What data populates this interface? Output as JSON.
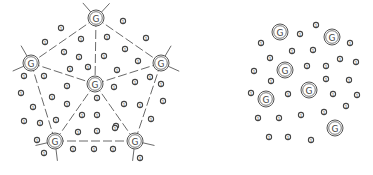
{
  "diagram": {
    "gateway_label": "G",
    "sensor_label": "1",
    "colors": {
      "stroke": "#555555",
      "edge": "#6a6a6a",
      "background": "#ffffff"
    },
    "left_panel": {
      "name": "structured-deployment",
      "gateways": [
        {
          "id": "g-top",
          "x": 96,
          "y": 18
        },
        {
          "id": "g-left",
          "x": 31,
          "y": 63
        },
        {
          "id": "g-right",
          "x": 161,
          "y": 63
        },
        {
          "id": "g-center",
          "x": 95,
          "y": 84
        },
        {
          "id": "g-bottom-left",
          "x": 55,
          "y": 141
        },
        {
          "id": "g-bottom-right",
          "x": 135,
          "y": 141
        }
      ],
      "edges": [
        [
          "g-top",
          "g-left"
        ],
        [
          "g-top",
          "g-right"
        ],
        [
          "g-top",
          "g-center"
        ],
        [
          "g-left",
          "g-center"
        ],
        [
          "g-right",
          "g-center"
        ],
        [
          "g-left",
          "g-bottom-left"
        ],
        [
          "g-right",
          "g-bottom-right"
        ],
        [
          "g-center",
          "g-bottom-left"
        ],
        [
          "g-center",
          "g-bottom-right"
        ],
        [
          "g-bottom-left",
          "g-bottom-right"
        ]
      ],
      "sensors": [
        [
          61,
          28
        ],
        [
          123,
          21
        ],
        [
          45,
          42
        ],
        [
          81,
          39
        ],
        [
          107,
          37
        ],
        [
          146,
          38
        ],
        [
          64,
          52
        ],
        [
          79,
          57
        ],
        [
          104,
          56
        ],
        [
          125,
          49
        ],
        [
          138,
          61
        ],
        [
          70,
          69
        ],
        [
          88,
          67
        ],
        [
          117,
          70
        ],
        [
          24,
          76
        ],
        [
          44,
          76
        ],
        [
          67,
          86
        ],
        [
          114,
          87
        ],
        [
          135,
          82
        ],
        [
          150,
          77
        ],
        [
          161,
          84
        ],
        [
          21,
          93
        ],
        [
          52,
          97
        ],
        [
          97,
          98
        ],
        [
          163,
          101
        ],
        [
          33,
          107
        ],
        [
          67,
          104
        ],
        [
          124,
          104
        ],
        [
          140,
          105
        ],
        [
          24,
          121
        ],
        [
          40,
          123
        ],
        [
          56,
          120
        ],
        [
          82,
          115
        ],
        [
          97,
          115
        ],
        [
          116,
          126
        ],
        [
          151,
          119
        ],
        [
          78,
          132
        ],
        [
          97,
          131
        ],
        [
          115,
          128
        ],
        [
          37,
          140
        ],
        [
          73,
          149
        ],
        [
          94,
          149
        ],
        [
          113,
          149
        ],
        [
          44,
          153
        ],
        [
          140,
          158
        ]
      ]
    },
    "right_panel": {
      "name": "random-deployment",
      "gateways": [
        {
          "id": "g-r1",
          "x": 280,
          "y": 32
        },
        {
          "id": "g-r2",
          "x": 332,
          "y": 37
        },
        {
          "id": "g-r3",
          "x": 285,
          "y": 70
        },
        {
          "id": "g-r4",
          "x": 309,
          "y": 90
        },
        {
          "id": "g-r5",
          "x": 266,
          "y": 99
        },
        {
          "id": "g-r6",
          "x": 335,
          "y": 128
        }
      ],
      "sensors": [
        [
          316,
          25
        ],
        [
          300,
          34
        ],
        [
          261,
          43
        ],
        [
          350,
          43
        ],
        [
          292,
          51
        ],
        [
          313,
          50
        ],
        [
          270,
          58
        ],
        [
          340,
          59
        ],
        [
          356,
          62
        ],
        [
          254,
          71
        ],
        [
          307,
          66
        ],
        [
          326,
          66
        ],
        [
          271,
          81
        ],
        [
          326,
          79
        ],
        [
          349,
          80
        ],
        [
          251,
          93
        ],
        [
          288,
          94
        ],
        [
          333,
          94
        ],
        [
          357,
          95
        ],
        [
          346,
          106
        ],
        [
          324,
          112
        ],
        [
          258,
          118
        ],
        [
          279,
          118
        ],
        [
          301,
          115
        ],
        [
          269,
          137
        ],
        [
          288,
          137
        ],
        [
          311,
          140
        ]
      ]
    }
  }
}
